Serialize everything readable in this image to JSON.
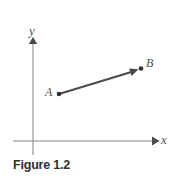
{
  "figure": {
    "caption": "Figure 1.2",
    "background_color": "#ffffff",
    "axis_color": "#8c8c8c",
    "vector_color": "#4a4a4a",
    "label_color": "#4f4f4f",
    "caption_color": "#2f2f2f"
  },
  "axes": {
    "x_label": "x",
    "y_label": "y",
    "origin": {
      "x": 33,
      "y": 141
    },
    "x_axis": {
      "start_x": 13,
      "end_x": 158,
      "y": 141,
      "arrow": "right"
    },
    "y_axis": {
      "x": 33,
      "start_y": 155,
      "end_y": 38,
      "arrow": "up"
    }
  },
  "points": [
    {
      "name": "A",
      "label": "A",
      "x": 59,
      "y": 94,
      "marker": "dot"
    },
    {
      "name": "B",
      "label": "B",
      "x": 140,
      "y": 69,
      "marker": "dot"
    }
  ],
  "vector": {
    "name": "AB",
    "from": "A",
    "to": "B",
    "from_x": 59,
    "from_y": 94,
    "to_x": 137,
    "to_y": 70,
    "arrow_head": "at-B"
  }
}
